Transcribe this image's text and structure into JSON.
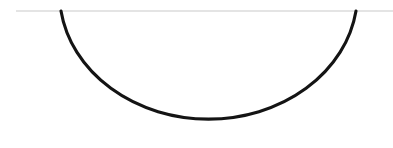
{
  "canvas": {
    "width": 393,
    "height": 148,
    "background_color": "#ffffff"
  },
  "figure": {
    "title": "",
    "chord_line": {
      "name": "horizontal-chord-line",
      "x1": 16,
      "y1": 11,
      "x2": 393,
      "y2": 11,
      "color": "#c9c9c9",
      "stroke_width": 1.2
    },
    "arc": {
      "name": "downward-arc",
      "start_x": 61,
      "start_y": 11,
      "end_x": 356,
      "end_y": 11,
      "bottom_x": 208,
      "bottom_y": 136,
      "radius_x": 149,
      "radius_y": 126,
      "sweep": "downward",
      "color": "#141414",
      "stroke_width": 3.1,
      "path": "M 61 11 A 149 126 0 0 0 356 11"
    }
  }
}
